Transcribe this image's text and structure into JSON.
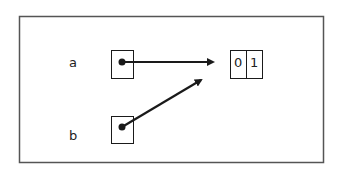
{
  "diagram": {
    "variables": [
      {
        "name": "a",
        "points_to": "array"
      },
      {
        "name": "b",
        "points_to": "array"
      }
    ],
    "array": {
      "cells": [
        "0",
        "1"
      ]
    },
    "colors": {
      "stroke": "#1a1a1a",
      "frame": "#555555",
      "background": "#ffffff"
    }
  }
}
